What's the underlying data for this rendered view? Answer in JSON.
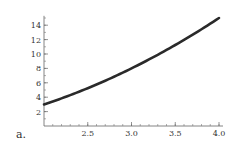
{
  "label": "a.",
  "chart_data": {
    "type": "line",
    "title": "",
    "xlabel": "",
    "ylabel": "",
    "function": "x^2 - 1",
    "xlim": [
      2.0,
      4.0
    ],
    "ylim": [
      0,
      15
    ],
    "x_ticks": [
      "2.5",
      "3.0",
      "3.5",
      "4.0"
    ],
    "y_ticks": [
      "2",
      "4",
      "6",
      "8",
      "10",
      "12",
      "14"
    ],
    "grid": false,
    "series": [
      {
        "name": "f(x)",
        "x": [
          2.0,
          2.25,
          2.5,
          2.75,
          3.0,
          3.25,
          3.5,
          3.75,
          4.0
        ],
        "y": [
          3.0,
          4.06,
          5.25,
          6.56,
          8.0,
          9.56,
          11.25,
          13.06,
          15.0
        ]
      }
    ]
  }
}
